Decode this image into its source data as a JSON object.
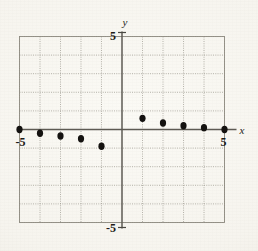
{
  "figure": {
    "name": "scatter-plot-figure",
    "background_color": "#f4f2ec",
    "ink_color": "#141210"
  },
  "axes": {
    "x_label": "x",
    "y_label": "y",
    "x_min_label": "-5",
    "x_max_label": "5",
    "y_min_label": "-5",
    "y_max_label": "5",
    "grid_color": "#9a968c",
    "axis_color": "#5d5a53"
  },
  "chart_data": {
    "type": "scatter",
    "title": "",
    "subtitle": "",
    "xlabel": "x",
    "ylabel": "y",
    "xlim": [
      -5,
      5
    ],
    "ylim": [
      -5,
      5
    ],
    "xticks": [
      -5,
      5
    ],
    "yticks": [
      -5,
      5
    ],
    "xtick_labels": [
      "-5",
      "5"
    ],
    "ytick_labels": [
      "-5",
      "5"
    ],
    "grid": true,
    "grid_step": 1,
    "legend": null,
    "legend_position": "none",
    "annotations": [],
    "marker": "filled-circle",
    "marker_color": "#141210",
    "series": [
      {
        "name": "data",
        "points": [
          {
            "x": -5,
            "y": 0.0
          },
          {
            "x": -4,
            "y": -0.2
          },
          {
            "x": -3,
            "y": -0.35
          },
          {
            "x": -2,
            "y": -0.5
          },
          {
            "x": -1,
            "y": -0.9
          },
          {
            "x": 1,
            "y": 0.6
          },
          {
            "x": 2,
            "y": 0.35
          },
          {
            "x": 3,
            "y": 0.2
          },
          {
            "x": 4,
            "y": 0.1
          },
          {
            "x": 5,
            "y": 0.0
          }
        ]
      }
    ]
  }
}
